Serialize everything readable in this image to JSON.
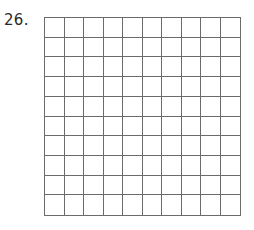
{
  "problem": {
    "number_label": "26.",
    "grid": {
      "rows": 10,
      "cols": 10,
      "line_color": "#6b6b6b"
    }
  }
}
